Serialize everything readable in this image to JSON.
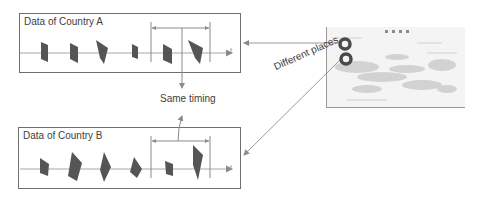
{
  "panels": {
    "country_a": {
      "title": "Data of Country A",
      "axis_label": "t"
    },
    "country_b": {
      "title": "Data of Country B",
      "axis_label": "t"
    }
  },
  "annotations": {
    "same_timing": "Same timing",
    "different_places": "Different places"
  },
  "map": {
    "legend_dots": 4,
    "markers": [
      "location-marker-a",
      "location-marker-b"
    ]
  },
  "colors": {
    "shape_fill": "#555555",
    "border": "#6f6f6f",
    "line": "#9a9a9a",
    "text": "#404040",
    "marker": "#4a4a4a"
  }
}
